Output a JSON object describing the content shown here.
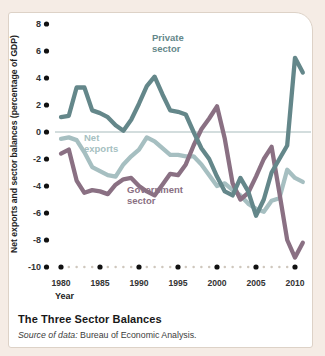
{
  "page": {
    "background_color": "#f5ece5",
    "card_background": "#ffffff"
  },
  "figure": {
    "title": "The Three Sector Balances",
    "source_prefix": "Source of data:",
    "source_rest": " Bureau of Economic Analysis."
  },
  "axes": {
    "y_label": "Net exports and sector balances (percentage of GDP)",
    "x_label": "Year",
    "y_tick_labels": [
      "8",
      "6",
      "4",
      "2",
      "0",
      "-2",
      "-4",
      "-6",
      "-8",
      "-10"
    ],
    "x_tick_labels": [
      "1980",
      "1985",
      "1990",
      "1995",
      "2000",
      "2005",
      "2010"
    ]
  },
  "chart_data": {
    "type": "line",
    "title": "The Three Sector Balances",
    "xlabel": "Year",
    "ylabel": "Net exports and sector balances (percentage of GDP)",
    "ylim": [
      -10,
      8
    ],
    "xlim": [
      1980,
      2011
    ],
    "yticks": [
      8,
      6,
      4,
      2,
      0,
      -2,
      -4,
      -6,
      -8,
      -10
    ],
    "xticks": [
      1980,
      1985,
      1990,
      1995,
      2000,
      2005,
      2010
    ],
    "grid": false,
    "zero_line": true,
    "legend_position": "inline-labels",
    "x": [
      1980,
      1981,
      1982,
      1983,
      1984,
      1985,
      1986,
      1987,
      1988,
      1989,
      1990,
      1991,
      1992,
      1993,
      1994,
      1995,
      1996,
      1997,
      1998,
      1999,
      2000,
      2001,
      2002,
      2003,
      2004,
      2005,
      2006,
      2007,
      2008,
      2009,
      2010,
      2011
    ],
    "series": [
      {
        "name": "Private sector",
        "label_lines": [
          "Private",
          "sector"
        ],
        "color": "#64878a",
        "values": [
          1.1,
          1.2,
          3.3,
          3.3,
          1.6,
          1.4,
          1.1,
          0.5,
          0.1,
          0.9,
          2.1,
          3.4,
          4.1,
          2.8,
          1.6,
          1.5,
          1.3,
          0.0,
          -1.2,
          -2.0,
          -3.3,
          -4.4,
          -4.7,
          -3.4,
          -4.4,
          -6.2,
          -5.0,
          -3.0,
          -2.0,
          -1.0,
          5.5,
          4.4
        ]
      },
      {
        "name": "Net exports",
        "label_lines": [
          "Net",
          "exports"
        ],
        "color": "#a6bfc1",
        "values": [
          -0.5,
          -0.4,
          -0.6,
          -1.5,
          -2.6,
          -2.9,
          -3.2,
          -3.3,
          -2.4,
          -1.8,
          -1.3,
          -0.4,
          -0.7,
          -1.2,
          -1.7,
          -1.7,
          -1.8,
          -1.8,
          -2.4,
          -3.2,
          -4.0,
          -3.8,
          -4.3,
          -4.7,
          -5.3,
          -5.7,
          -5.9,
          -5.1,
          -4.9,
          -2.8,
          -3.4,
          -3.7
        ]
      },
      {
        "name": "Government sector",
        "label_lines": [
          "Government",
          "sector"
        ],
        "color": "#8a7083",
        "values": [
          -1.6,
          -1.3,
          -3.6,
          -4.5,
          -4.3,
          -4.4,
          -4.6,
          -3.9,
          -3.5,
          -3.4,
          -4.0,
          -4.4,
          -4.7,
          -3.9,
          -3.1,
          -3.2,
          -2.4,
          -1.0,
          0.2,
          1.0,
          1.9,
          -0.5,
          -3.8,
          -5.0,
          -4.5,
          -3.3,
          -2.0,
          -1.1,
          -4.5,
          -8.0,
          -9.3,
          -8.2
        ]
      }
    ],
    "style": {
      "line_width": 4.3,
      "axis_dot_color": "#111111",
      "minor_dot_color": "#cfc7bd",
      "zero_line_color": "#9db3b4",
      "tick_text_color": "#333333"
    }
  }
}
